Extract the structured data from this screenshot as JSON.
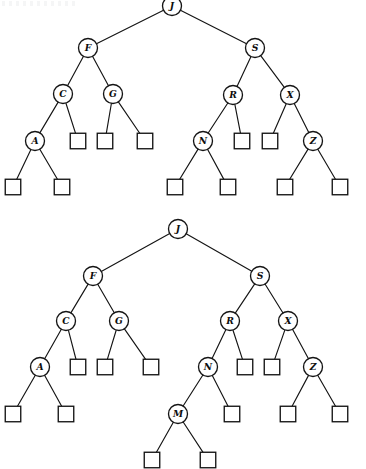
{
  "figure": {
    "caption": "",
    "background_color": "#ffffff",
    "stroke_color": "#141414",
    "node_fill": "#ffffff",
    "circle_radius": 9.5,
    "square_size": 15.5
  },
  "diagrams": [
    {
      "id": "tree-upper",
      "name": "binary-search-tree-before-insert",
      "type": "binary-tree",
      "internal_nodes": [
        {
          "label": "J",
          "x": 172,
          "y": 6
        },
        {
          "label": "F",
          "x": 88,
          "y": 48
        },
        {
          "label": "S",
          "x": 255,
          "y": 48
        },
        {
          "label": "C",
          "x": 63,
          "y": 94
        },
        {
          "label": "G",
          "x": 113,
          "y": 94
        },
        {
          "label": "R",
          "x": 233,
          "y": 95
        },
        {
          "label": "X",
          "x": 290,
          "y": 95
        },
        {
          "label": "A",
          "x": 35,
          "y": 141
        },
        {
          "label": "N",
          "x": 203,
          "y": 141
        },
        {
          "label": "Z",
          "x": 313,
          "y": 141
        }
      ],
      "leaf_nodes": [
        {
          "x": 78,
          "y": 141
        },
        {
          "x": 105,
          "y": 141
        },
        {
          "x": 145,
          "y": 141
        },
        {
          "x": 242,
          "y": 141
        },
        {
          "x": 270,
          "y": 141
        },
        {
          "x": 13,
          "y": 187
        },
        {
          "x": 62,
          "y": 187
        },
        {
          "x": 175,
          "y": 187
        },
        {
          "x": 228,
          "y": 187
        },
        {
          "x": 285,
          "y": 187
        },
        {
          "x": 340,
          "y": 187
        }
      ],
      "edges": [
        {
          "from": "J",
          "to": "F",
          "x1": 172,
          "y1": 6,
          "x2": 88,
          "y2": 48
        },
        {
          "from": "J",
          "to": "S",
          "x1": 172,
          "y1": 6,
          "x2": 255,
          "y2": 48
        },
        {
          "from": "F",
          "to": "C",
          "x1": 88,
          "y1": 48,
          "x2": 63,
          "y2": 94
        },
        {
          "from": "F",
          "to": "G",
          "x1": 88,
          "y1": 48,
          "x2": 113,
          "y2": 94
        },
        {
          "from": "S",
          "to": "R",
          "x1": 255,
          "y1": 48,
          "x2": 233,
          "y2": 95
        },
        {
          "from": "S",
          "to": "X",
          "x1": 255,
          "y1": 48,
          "x2": 290,
          "y2": 95
        },
        {
          "from": "C",
          "to": "A",
          "x1": 63,
          "y1": 94,
          "x2": 35,
          "y2": 141
        },
        {
          "from": "C",
          "to": "leaf",
          "x1": 63,
          "y1": 94,
          "x2": 78,
          "y2": 141
        },
        {
          "from": "G",
          "to": "leaf",
          "x1": 113,
          "y1": 94,
          "x2": 105,
          "y2": 141
        },
        {
          "from": "G",
          "to": "leaf",
          "x1": 113,
          "y1": 94,
          "x2": 145,
          "y2": 141
        },
        {
          "from": "R",
          "to": "N",
          "x1": 233,
          "y1": 95,
          "x2": 203,
          "y2": 141
        },
        {
          "from": "R",
          "to": "leaf",
          "x1": 233,
          "y1": 95,
          "x2": 242,
          "y2": 141
        },
        {
          "from": "X",
          "to": "leaf",
          "x1": 290,
          "y1": 95,
          "x2": 270,
          "y2": 141
        },
        {
          "from": "X",
          "to": "Z",
          "x1": 290,
          "y1": 95,
          "x2": 313,
          "y2": 141
        },
        {
          "from": "A",
          "to": "leaf",
          "x1": 35,
          "y1": 141,
          "x2": 13,
          "y2": 187
        },
        {
          "from": "A",
          "to": "leaf",
          "x1": 35,
          "y1": 141,
          "x2": 62,
          "y2": 187
        },
        {
          "from": "N",
          "to": "leaf",
          "x1": 203,
          "y1": 141,
          "x2": 175,
          "y2": 187
        },
        {
          "from": "N",
          "to": "leaf",
          "x1": 203,
          "y1": 141,
          "x2": 228,
          "y2": 187
        },
        {
          "from": "Z",
          "to": "leaf",
          "x1": 313,
          "y1": 141,
          "x2": 285,
          "y2": 187
        },
        {
          "from": "Z",
          "to": "leaf",
          "x1": 313,
          "y1": 141,
          "x2": 340,
          "y2": 187
        }
      ]
    },
    {
      "id": "tree-lower",
      "name": "binary-search-tree-after-insert-M",
      "type": "binary-tree",
      "internal_nodes": [
        {
          "label": "J",
          "x": 178,
          "y": 229
        },
        {
          "label": "F",
          "x": 93,
          "y": 276
        },
        {
          "label": "S",
          "x": 260,
          "y": 276
        },
        {
          "label": "C",
          "x": 66,
          "y": 321
        },
        {
          "label": "G",
          "x": 119,
          "y": 321
        },
        {
          "label": "R",
          "x": 230,
          "y": 321
        },
        {
          "label": "X",
          "x": 288,
          "y": 321
        },
        {
          "label": "A",
          "x": 40,
          "y": 367
        },
        {
          "label": "N",
          "x": 208,
          "y": 367
        },
        {
          "label": "Z",
          "x": 313,
          "y": 367
        },
        {
          "label": "M",
          "x": 178,
          "y": 414
        }
      ],
      "leaf_nodes": [
        {
          "x": 78,
          "y": 367
        },
        {
          "x": 105,
          "y": 367
        },
        {
          "x": 151,
          "y": 367
        },
        {
          "x": 245,
          "y": 367
        },
        {
          "x": 272,
          "y": 367
        },
        {
          "x": 13,
          "y": 414
        },
        {
          "x": 66,
          "y": 414
        },
        {
          "x": 232,
          "y": 414
        },
        {
          "x": 288,
          "y": 414
        },
        {
          "x": 340,
          "y": 414
        },
        {
          "x": 152,
          "y": 460
        },
        {
          "x": 208,
          "y": 460
        }
      ],
      "edges": [
        {
          "from": "J",
          "to": "F",
          "x1": 178,
          "y1": 229,
          "x2": 93,
          "y2": 276
        },
        {
          "from": "J",
          "to": "S",
          "x1": 178,
          "y1": 229,
          "x2": 260,
          "y2": 276
        },
        {
          "from": "F",
          "to": "C",
          "x1": 93,
          "y1": 276,
          "x2": 66,
          "y2": 321
        },
        {
          "from": "F",
          "to": "G",
          "x1": 93,
          "y1": 276,
          "x2": 119,
          "y2": 321
        },
        {
          "from": "S",
          "to": "R",
          "x1": 260,
          "y1": 276,
          "x2": 230,
          "y2": 321
        },
        {
          "from": "S",
          "to": "X",
          "x1": 260,
          "y1": 276,
          "x2": 288,
          "y2": 321
        },
        {
          "from": "C",
          "to": "A",
          "x1": 66,
          "y1": 321,
          "x2": 40,
          "y2": 367
        },
        {
          "from": "C",
          "to": "leaf",
          "x1": 66,
          "y1": 321,
          "x2": 78,
          "y2": 367
        },
        {
          "from": "G",
          "to": "leaf",
          "x1": 119,
          "y1": 321,
          "x2": 105,
          "y2": 367
        },
        {
          "from": "G",
          "to": "leaf",
          "x1": 119,
          "y1": 321,
          "x2": 151,
          "y2": 367
        },
        {
          "from": "R",
          "to": "N",
          "x1": 230,
          "y1": 321,
          "x2": 208,
          "y2": 367
        },
        {
          "from": "R",
          "to": "leaf",
          "x1": 230,
          "y1": 321,
          "x2": 245,
          "y2": 367
        },
        {
          "from": "X",
          "to": "leaf",
          "x1": 288,
          "y1": 321,
          "x2": 272,
          "y2": 367
        },
        {
          "from": "X",
          "to": "Z",
          "x1": 288,
          "y1": 321,
          "x2": 313,
          "y2": 367
        },
        {
          "from": "A",
          "to": "leaf",
          "x1": 40,
          "y1": 367,
          "x2": 13,
          "y2": 414
        },
        {
          "from": "A",
          "to": "leaf",
          "x1": 40,
          "y1": 367,
          "x2": 66,
          "y2": 414
        },
        {
          "from": "N",
          "to": "M",
          "x1": 208,
          "y1": 367,
          "x2": 178,
          "y2": 414
        },
        {
          "from": "N",
          "to": "leaf",
          "x1": 208,
          "y1": 367,
          "x2": 232,
          "y2": 414
        },
        {
          "from": "Z",
          "to": "leaf",
          "x1": 313,
          "y1": 367,
          "x2": 288,
          "y2": 414
        },
        {
          "from": "Z",
          "to": "leaf",
          "x1": 313,
          "y1": 367,
          "x2": 340,
          "y2": 414
        },
        {
          "from": "M",
          "to": "leaf",
          "x1": 178,
          "y1": 414,
          "x2": 152,
          "y2": 460
        },
        {
          "from": "M",
          "to": "leaf",
          "x1": 178,
          "y1": 414,
          "x2": 208,
          "y2": 460
        }
      ]
    }
  ]
}
